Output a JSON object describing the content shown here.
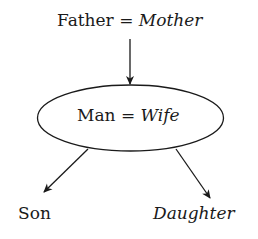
{
  "diagram": {
    "top_node": {
      "left": "Father",
      "eq": "=",
      "right": "Mother"
    },
    "middle_node": {
      "left": "Man",
      "eq": "=",
      "right": "Wife"
    },
    "children": [
      {
        "label": "Son",
        "italic": false
      },
      {
        "label": "Daughter",
        "italic": true
      }
    ]
  },
  "colors": {
    "stroke": "#1a1a1a",
    "background": "#ffffff"
  }
}
